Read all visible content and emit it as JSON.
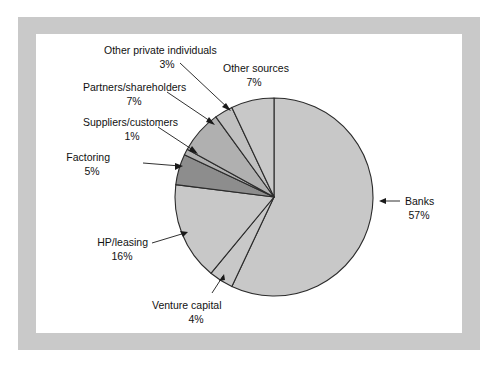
{
  "figure": {
    "background_color": "#ffffff",
    "frame_color": "#c9c9c9",
    "plot_background_color": "#ffffff"
  },
  "chart_data": {
    "type": "pie",
    "title": "",
    "subtitle": "",
    "xlabel": "",
    "ylabel": "",
    "legend_position": "none",
    "grid": false,
    "start_angle_deg": 0,
    "direction": "clockwise",
    "unit": "%",
    "categories": [
      "Banks",
      "Venture capital",
      "HP/leasing",
      "Factoring",
      "Suppliers/customers",
      "Partners/shareholders",
      "Other private individuals",
      "Other sources"
    ],
    "values": [
      57,
      4,
      16,
      5,
      1,
      7,
      3,
      7
    ],
    "slices": [
      {
        "label": "Banks",
        "value": 57,
        "value_text": "57%",
        "color": "#c8c8c8",
        "start_deg": 0,
        "end_deg": 205.2
      },
      {
        "label": "Venture capital",
        "value": 4,
        "value_text": "4%",
        "color": "#c8c8c8",
        "start_deg": 205.2,
        "end_deg": 219.6
      },
      {
        "label": "HP/leasing",
        "value": 16,
        "value_text": "16%",
        "color": "#c8c8c8",
        "start_deg": 219.6,
        "end_deg": 277.2
      },
      {
        "label": "Factoring",
        "value": 5,
        "value_text": "5%",
        "color": "#8d8d8d",
        "start_deg": 277.2,
        "end_deg": 295.2
      },
      {
        "label": "Suppliers/customers",
        "value": 1,
        "value_text": "1%",
        "color": "#b0b0b0",
        "start_deg": 295.2,
        "end_deg": 298.8
      },
      {
        "label": "Partners/shareholders",
        "value": 7,
        "value_text": "7%",
        "color": "#b0b0b0",
        "start_deg": 298.8,
        "end_deg": 324.0
      },
      {
        "label": "Other private individuals",
        "value": 3,
        "value_text": "3%",
        "color": "#c0c0c0",
        "start_deg": 324.0,
        "end_deg": 334.8
      },
      {
        "label": "Other sources",
        "value": 7,
        "value_text": "7%",
        "color": "#c8c8c8",
        "start_deg": 334.8,
        "end_deg": 360.0
      }
    ]
  },
  "callouts": {
    "other_private_individuals": {
      "name": "Other private individuals",
      "percent": "3%"
    },
    "other_sources": {
      "name": "Other sources",
      "percent": "7%"
    },
    "partners_shareholders": {
      "name": "Partners/shareholders",
      "percent": "7%"
    },
    "suppliers_customers": {
      "name": "Suppliers/customers",
      "percent": "1%"
    },
    "factoring": {
      "name": "Factoring",
      "percent": "5%"
    },
    "hp_leasing": {
      "name": "HP/leasing",
      "percent": "16%"
    },
    "venture_capital": {
      "name": "Venture capital",
      "percent": "4%"
    },
    "banks": {
      "name": "Banks",
      "percent": "57%"
    }
  }
}
